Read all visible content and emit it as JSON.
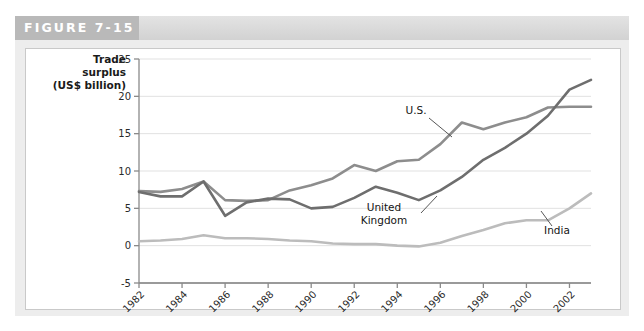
{
  "figure": {
    "label": "FIGURE 7-15"
  },
  "chart_data": {
    "type": "line",
    "title": "",
    "xlabel": "",
    "ylabel": "Trade surplus (US$ billion)",
    "ylabel_lines": [
      "Trade",
      "surplus",
      "(US$ billion)"
    ],
    "grid": true,
    "legend_position": "inline-annotations",
    "xlim": [
      1982,
      2003
    ],
    "ylim": [
      -5,
      25
    ],
    "yticks": [
      25,
      20,
      15,
      10,
      5,
      0,
      -5
    ],
    "xticks": [
      1982,
      1984,
      1986,
      1988,
      1990,
      1992,
      1994,
      1996,
      1998,
      2000,
      2002
    ],
    "x": [
      1982,
      1983,
      1984,
      1985,
      1986,
      1987,
      1988,
      1989,
      1990,
      1991,
      1992,
      1993,
      1994,
      1995,
      1996,
      1997,
      1998,
      1999,
      2000,
      2001,
      2002,
      2003
    ],
    "series": [
      {
        "name": "U.S.",
        "color": "#8d8d8d",
        "values": [
          7.3,
          7.2,
          7.6,
          8.6,
          6.1,
          6.0,
          6.1,
          7.4,
          8.1,
          9.0,
          10.8,
          10.0,
          11.3,
          11.5,
          13.6,
          16.5,
          15.6,
          16.5,
          17.2,
          18.5,
          18.6,
          18.6
        ]
      },
      {
        "name": "United Kingdom",
        "color": "#6e6e6e",
        "values": [
          7.2,
          6.6,
          6.6,
          8.6,
          4.0,
          5.8,
          6.3,
          6.2,
          5.0,
          5.2,
          6.4,
          7.9,
          7.1,
          6.1,
          7.4,
          9.2,
          11.5,
          13.1,
          15.0,
          17.4,
          20.9,
          22.2
        ]
      },
      {
        "name": "India",
        "color": "#bcbcbc",
        "values": [
          0.6,
          0.7,
          0.9,
          1.4,
          1.0,
          1.0,
          0.9,
          0.7,
          0.6,
          0.3,
          0.2,
          0.2,
          0.0,
          -0.1,
          0.4,
          1.3,
          2.1,
          3.0,
          3.4,
          3.4,
          5.0,
          7.0
        ]
      }
    ],
    "annotations": [
      {
        "name": "us-label",
        "text": "U.S."
      },
      {
        "name": "uk-label",
        "text": "United\nKingdom"
      },
      {
        "name": "india-label",
        "text": "India"
      }
    ]
  },
  "colors": {
    "header_tab": "#b9b9b9",
    "header_strip": "#dcdcdc",
    "panel": "#ededed",
    "grid": "#e1e1e1",
    "axis": "#8a8a8a"
  }
}
